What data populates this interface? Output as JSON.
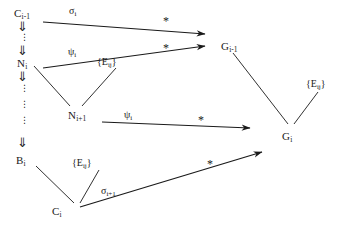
{
  "figure": {
    "type": "commutative-diagram",
    "ink_color": "#1a1a1a",
    "background_color": "#ffffff",
    "width": 351,
    "height": 240
  },
  "nodes": [
    {
      "id": "C_i_minus_1",
      "base": "C",
      "sub": "i-1",
      "x": 14,
      "y": 8,
      "name": "node-c-i-minus-1"
    },
    {
      "id": "N_i",
      "base": "N",
      "sub": "i",
      "x": 17,
      "y": 58,
      "name": "node-n-i"
    },
    {
      "id": "N_i_plus_1",
      "base": "N",
      "sub": "i+1",
      "x": 68,
      "y": 110,
      "name": "node-n-i-plus-1"
    },
    {
      "id": "B_i",
      "base": "B",
      "sub": "i",
      "x": 16,
      "y": 155,
      "name": "node-b-i"
    },
    {
      "id": "C_i",
      "base": "C",
      "sub": "i",
      "x": 52,
      "y": 206,
      "name": "node-c-i"
    },
    {
      "id": "G_i_minus_1",
      "base": "G",
      "sub": "i-1",
      "x": 221,
      "y": 41,
      "name": "node-g-i-minus-1"
    },
    {
      "id": "G_i",
      "base": "G",
      "sub": "i",
      "x": 282,
      "y": 131,
      "name": "node-g-i"
    }
  ],
  "set_labels": [
    {
      "id": "E_mid",
      "text": "{E",
      "sub": "ij",
      "close": "}",
      "x": 97,
      "y": 57,
      "name": "set-label-e-ij-middle"
    },
    {
      "id": "E_bottom",
      "text": "{E",
      "sub": "ij",
      "close": "}",
      "x": 72,
      "y": 158,
      "name": "set-label-e-ij-bottom"
    },
    {
      "id": "E_right",
      "text": "{E",
      "sub": "ij",
      "close": "}",
      "x": 306,
      "y": 79,
      "name": "set-label-e-ij-right"
    }
  ],
  "edge_labels": [
    {
      "id": "sigma_i",
      "base": "σ",
      "sub": "i",
      "x": 69,
      "y": 6,
      "name": "edge-label-sigma-i"
    },
    {
      "id": "psi_i_top",
      "base": "ψ",
      "sub": "i",
      "x": 68,
      "y": 47,
      "name": "edge-label-psi-i-top"
    },
    {
      "id": "psi_i_mid",
      "base": "ψ",
      "sub": "i",
      "x": 124,
      "y": 110,
      "name": "edge-label-psi-i-middle"
    },
    {
      "id": "sigma_i_p1",
      "base": "σ",
      "sub": "i+1",
      "x": 101,
      "y": 186,
      "name": "edge-label-sigma-i-plus-1"
    }
  ],
  "star_labels": [
    {
      "id": "star_1",
      "text": "*",
      "x": 163,
      "y": 15,
      "name": "star-label-top"
    },
    {
      "id": "star_2",
      "text": "*",
      "x": 163,
      "y": 42,
      "name": "star-label-second"
    },
    {
      "id": "star_3",
      "text": "*",
      "x": 198,
      "y": 114,
      "name": "star-label-third"
    },
    {
      "id": "star_4",
      "text": "*",
      "x": 207,
      "y": 158,
      "name": "star-label-bottom"
    }
  ],
  "vertical_chain": [
    {
      "id": "dbl_1",
      "glyph": "⇓",
      "x": 17,
      "y": 20,
      "name": "double-down-arrow-1"
    },
    {
      "id": "dots_1",
      "glyph": "⋮",
      "x": 20,
      "y": 33,
      "name": "vertical-dots-1"
    },
    {
      "id": "dbl_2",
      "glyph": "⇓",
      "x": 17,
      "y": 44,
      "name": "double-down-arrow-2"
    },
    {
      "id": "dbl_3",
      "glyph": "⇓",
      "x": 17,
      "y": 70,
      "name": "double-down-arrow-3"
    },
    {
      "id": "dots_2",
      "glyph": "⋮",
      "x": 20,
      "y": 84,
      "name": "vertical-dots-2"
    },
    {
      "id": "dots_3",
      "glyph": "⋮",
      "x": 20,
      "y": 100,
      "name": "vertical-dots-3"
    },
    {
      "id": "dots_4",
      "glyph": "⋮",
      "x": 20,
      "y": 116,
      "name": "vertical-dots-4"
    },
    {
      "id": "dbl_4",
      "glyph": "⇓",
      "x": 17,
      "y": 136,
      "name": "double-down-arrow-4"
    }
  ],
  "arrows": [
    {
      "id": "a1",
      "name": "arrow-sigma-i",
      "x1": 43,
      "y1": 22,
      "x2": 205,
      "y2": 34,
      "head": true
    },
    {
      "id": "a2",
      "name": "arrow-psi-i-top",
      "x1": 43,
      "y1": 68,
      "x2": 205,
      "y2": 46,
      "head": true
    },
    {
      "id": "a3",
      "name": "arrow-psi-i-middle",
      "x1": 102,
      "y1": 122,
      "x2": 250,
      "y2": 128,
      "head": true
    },
    {
      "id": "a4",
      "name": "arrow-sigma-i-p1",
      "x1": 80,
      "y1": 207,
      "x2": 262,
      "y2": 152,
      "head": true
    }
  ],
  "connectors": [
    {
      "id": "c1",
      "name": "connector-n-i-to-n-i-plus-1",
      "x1": 34,
      "y1": 66,
      "x2": 70,
      "y2": 106
    },
    {
      "id": "c2",
      "name": "connector-n-i-plus-1-to-e",
      "x1": 82,
      "y1": 106,
      "x2": 116,
      "y2": 68
    },
    {
      "id": "c3",
      "name": "connector-b-i-to-c-i",
      "x1": 36,
      "y1": 166,
      "x2": 74,
      "y2": 203
    },
    {
      "id": "c4",
      "name": "connector-c-i-to-e",
      "x1": 80,
      "y1": 203,
      "x2": 99,
      "y2": 170
    },
    {
      "id": "c5",
      "name": "connector-g-i-minus-1-to-g-i",
      "x1": 233,
      "y1": 53,
      "x2": 288,
      "y2": 124
    },
    {
      "id": "c6",
      "name": "connector-g-i-to-e",
      "x1": 294,
      "y1": 124,
      "x2": 318,
      "y2": 92
    }
  ]
}
